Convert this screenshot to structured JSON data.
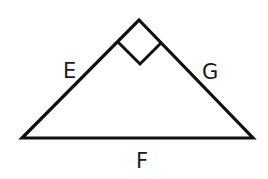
{
  "diagram": {
    "type": "right-triangle",
    "stroke_color": "#111111",
    "background_color": "#ffffff",
    "stroke_width": 3.2,
    "vertices": {
      "apex": [
        139,
        20
      ],
      "bottom_left": [
        22,
        138
      ],
      "bottom_right": [
        253,
        138
      ]
    },
    "right_angle_marker": {
      "at": "apex",
      "points": [
        [
          118,
          42
        ],
        [
          140,
          64
        ],
        [
          162,
          42
        ]
      ]
    },
    "sides": [
      {
        "id": "E",
        "label": "E",
        "between": [
          "bottom_left",
          "apex"
        ],
        "label_pos": [
          63,
          78
        ]
      },
      {
        "id": "G",
        "label": "G",
        "between": [
          "apex",
          "bottom_right"
        ],
        "label_pos": [
          202,
          79
        ]
      },
      {
        "id": "F",
        "label": "F",
        "between": [
          "bottom_left",
          "bottom_right"
        ],
        "label_pos": [
          136,
          168
        ]
      }
    ]
  }
}
